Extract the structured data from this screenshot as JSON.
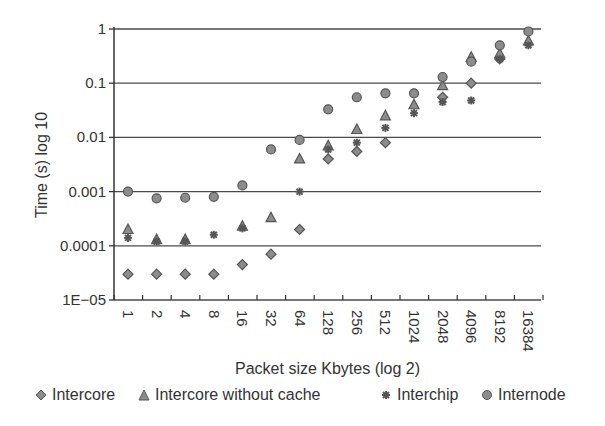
{
  "chart_data": {
    "type": "scatter",
    "title": "",
    "xlabel": "Packet size Kbytes (log 2)",
    "ylabel": "Time (s) log 10",
    "yscale": "log10",
    "ylim": [
      1e-05,
      1
    ],
    "yticks": [
      "1",
      "0.1",
      "0.01",
      "0.001",
      "0.0001",
      "1E−05"
    ],
    "ytick_values": [
      1,
      0.1,
      0.01,
      0.001,
      0.0001,
      1e-05
    ],
    "grid": "horizontal",
    "legend_position": "bottom",
    "categories": [
      "1",
      "2",
      "4",
      "8",
      "16",
      "32",
      "64",
      "128",
      "256",
      "512",
      "1024",
      "2048",
      "4096",
      "8192",
      "16384"
    ],
    "series": [
      {
        "name": "Intercore",
        "marker": "diamond",
        "values": [
          3e-05,
          3e-05,
          3e-05,
          3e-05,
          4.5e-05,
          7e-05,
          0.0002,
          0.004,
          0.0055,
          0.008,
          null,
          0.055,
          0.1,
          0.28,
          null
        ]
      },
      {
        "name": "Intercore without cache",
        "marker": "triangle",
        "values": [
          0.0002,
          0.00013,
          0.00013,
          null,
          0.00023,
          0.00033,
          0.004,
          0.007,
          0.014,
          0.025,
          0.04,
          0.09,
          0.3,
          0.35,
          0.6
        ]
      },
      {
        "name": "Interchip",
        "marker": "star",
        "values": [
          0.00014,
          0.00012,
          0.00012,
          0.00016,
          0.00021,
          null,
          0.001,
          0.006,
          0.008,
          0.015,
          0.028,
          0.045,
          0.048,
          0.28,
          0.5
        ]
      },
      {
        "name": "Internode",
        "marker": "circle",
        "values": [
          0.001,
          0.00075,
          0.00077,
          0.0008,
          0.0013,
          0.006,
          0.009,
          0.033,
          0.055,
          0.065,
          0.065,
          0.13,
          0.25,
          0.5,
          0.9
        ]
      }
    ]
  },
  "style": {
    "marker_fill": "#8c8c8c",
    "marker_stroke": "#555555",
    "grid_color": "#4a4a4a",
    "axis_color": "#333333"
  }
}
